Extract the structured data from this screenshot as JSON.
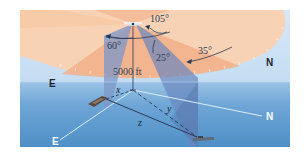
{
  "diagram": {
    "labels": {
      "angle_top": "105°",
      "angle_left": "60°",
      "angle_mid": "25°",
      "angle_right": "35°",
      "altitude": "5000 ft",
      "compass_sky_east": "E",
      "compass_sky_north": "N",
      "compass_sea_east": "E",
      "compass_sea_north": "N",
      "distance_x": "x",
      "distance_y": "y",
      "distance_z": "z"
    },
    "colors": {
      "sky_disc": "#f8d2b4",
      "sky_wedge_dark": "#f2b08a",
      "sky_bg": "#cfe3f5",
      "sea_top": "#8ab8df",
      "sea_bottom": "#4f8fc6",
      "beam": "#7c97c8",
      "line": "#2a3b55",
      "compass_line": "#dcebf8"
    }
  }
}
